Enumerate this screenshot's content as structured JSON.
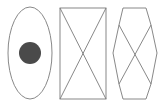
{
  "diagram": {
    "title": "",
    "colors": {
      "stroke": "#7a7a7a",
      "fill_dot": "#4a4a4a",
      "background": "#ffffff"
    },
    "shapes": [
      {
        "id": "ellipse",
        "type": "ellipse",
        "label": "",
        "cx": 30,
        "cy": 53,
        "rx": 22,
        "ry": 46,
        "contains": {
          "type": "filled-circle",
          "cx": 30,
          "cy": 53,
          "r": 11
        }
      },
      {
        "id": "rectangle",
        "type": "rectangle-with-diagonals",
        "label": "",
        "x": 60,
        "y": 8,
        "w": 46,
        "h": 91
      },
      {
        "id": "hexagon",
        "type": "hexagon-with-diagonals",
        "label": "",
        "points": [
          [
            123,
            8
          ],
          [
            146,
            8
          ],
          [
            151,
            25
          ],
          [
            157,
            53
          ],
          [
            151,
            84
          ],
          [
            146,
            99
          ],
          [
            123,
            99
          ],
          [
            119,
            84
          ],
          [
            113,
            53
          ],
          [
            119,
            25
          ]
        ]
      }
    ]
  }
}
